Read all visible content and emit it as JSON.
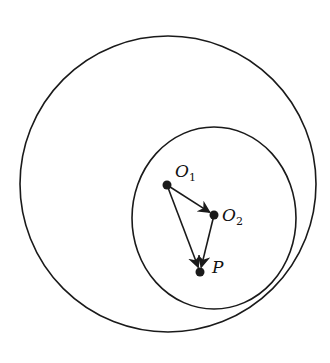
{
  "diagram": {
    "outer_circle": {
      "cx": 168,
      "cy": 184,
      "r": 148
    },
    "inner_circle": {
      "cx": 214,
      "cy": 218,
      "rx": 82,
      "ry": 91
    },
    "points": [
      {
        "id": "O1",
        "letter": "O",
        "sub": "1",
        "x": 167,
        "y": 185,
        "label_x": 175,
        "label_y": 163
      },
      {
        "id": "O2",
        "letter": "O",
        "sub": "2",
        "x": 214,
        "y": 215,
        "label_x": 222,
        "label_y": 207
      },
      {
        "id": "P",
        "letter": "P",
        "sub": "",
        "x": 200,
        "y": 272,
        "label_x": 212,
        "label_y": 259
      }
    ],
    "vectors": [
      {
        "from": "O1",
        "to": "O2"
      },
      {
        "from": "O2",
        "to": "P"
      },
      {
        "from": "O1",
        "to": "P"
      }
    ],
    "stroke_color": "#1a1a1a",
    "caption": ""
  }
}
